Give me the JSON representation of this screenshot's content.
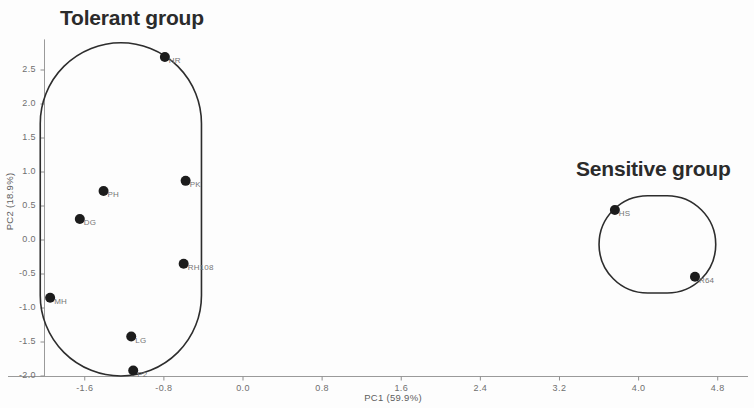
{
  "figure": {
    "background_color": "#fdfdfd",
    "point_color": "#1c1c1c",
    "hull_color": "#2d2d2d",
    "axis_color": "#9a9a9a"
  },
  "annotations": {
    "tolerant_group_label": "Tolerant group",
    "sensitive_group_label": "Sensitive group"
  },
  "chart_data": {
    "type": "scatter",
    "title": "",
    "xlabel": "PC1 (59.9%)",
    "ylabel": "PC2 (18.9%)",
    "xlim": [
      -2.2,
      5.2
    ],
    "ylim": [
      -2.05,
      2.95
    ],
    "grid": false,
    "legend_position": "none",
    "xticks": [
      "-1.6",
      "-0.8",
      "0.0",
      "0.8",
      "1.6",
      "2.4",
      "3.2",
      "4.0",
      "4.8"
    ],
    "xtick_values": [
      -1.6,
      -0.8,
      0.0,
      0.8,
      1.6,
      2.4,
      3.2,
      4.0,
      4.8
    ],
    "yticks": [
      "2.5",
      "2.0",
      "1.5",
      "1.0",
      "0.5",
      "0.0",
      "-0.5",
      "-1.0",
      "-1.5",
      "-2.0"
    ],
    "ytick_values": [
      2.5,
      2.0,
      1.5,
      1.0,
      0.5,
      0.0,
      -0.5,
      -1.0,
      -1.5,
      -2.0
    ],
    "groups": [
      {
        "name": "Tolerant group",
        "hull": {
          "type": "stadium",
          "x_min": -2.05,
          "x_max": -0.42,
          "y_min": -2.0,
          "y_max": 2.9
        }
      },
      {
        "name": "Sensitive group",
        "hull": {
          "type": "stadium",
          "x_min": 3.6,
          "x_max": 4.78,
          "y_min": -0.78,
          "y_max": 0.65
        }
      }
    ],
    "points": [
      {
        "label": "HR",
        "x": -0.79,
        "y": 2.69,
        "group": "Tolerant group"
      },
      {
        "label": "PK",
        "x": -0.58,
        "y": 0.87,
        "group": "Tolerant group"
      },
      {
        "label": "PH",
        "x": -1.41,
        "y": 0.72,
        "group": "Tolerant group"
      },
      {
        "label": "DG",
        "x": -1.65,
        "y": 0.31,
        "group": "Tolerant group"
      },
      {
        "label": "RH108",
        "x": -0.6,
        "y": -0.35,
        "group": "Tolerant group"
      },
      {
        "label": "MH",
        "x": -1.95,
        "y": -0.85,
        "group": "Tolerant group"
      },
      {
        "label": "LG",
        "x": -1.13,
        "y": -1.42,
        "group": "Tolerant group"
      },
      {
        "label": "P2",
        "x": -1.11,
        "y": -1.92,
        "group": "Tolerant group"
      },
      {
        "label": "HS",
        "x": 3.76,
        "y": 0.44,
        "group": "Sensitive group"
      },
      {
        "label": "R64",
        "x": 4.57,
        "y": -0.54,
        "group": "Sensitive group"
      }
    ]
  }
}
